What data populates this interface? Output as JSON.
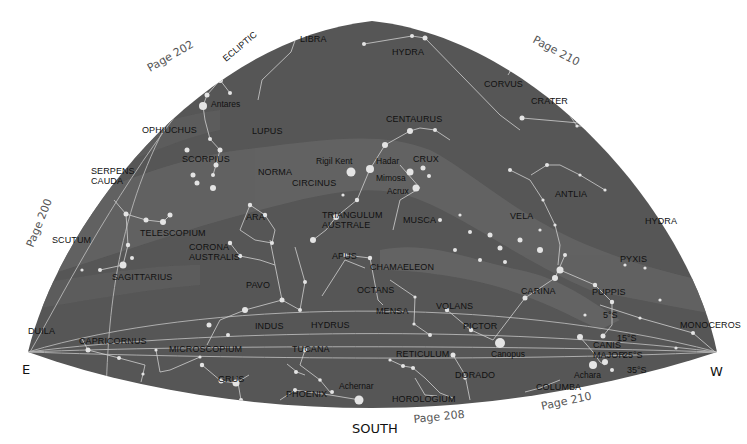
{
  "map": {
    "title": "Southern sky star chart",
    "directions": {
      "east": "E",
      "west": "W",
      "south": "SOUTH"
    },
    "page_refs": [
      {
        "label": "Page 202",
        "x": 150,
        "y": 72,
        "rot": -30
      },
      {
        "label": "Page 210",
        "x": 532,
        "y": 42,
        "rot": 28
      },
      {
        "label": "Page 200",
        "x": 33,
        "y": 248,
        "rot": -68
      },
      {
        "label": "Page 208",
        "x": 414,
        "y": 423,
        "rot": -6
      },
      {
        "label": "Page 210",
        "x": 542,
        "y": 410,
        "rot": -12
      }
    ],
    "ecliptic_label": {
      "label": "ECLIPTIC",
      "x": 226,
      "y": 62,
      "rot": -40
    },
    "declination_labels": [
      {
        "label": "5°S",
        "x": 603,
        "y": 318
      },
      {
        "label": "15°S",
        "x": 617,
        "y": 341
      },
      {
        "label": "25°S",
        "x": 623,
        "y": 358
      },
      {
        "label": "35°S",
        "x": 627,
        "y": 373
      }
    ],
    "constellations": [
      {
        "name": "LIBRA",
        "x": 300,
        "y": 42
      },
      {
        "name": "HYDRA",
        "x": 392,
        "y": 55
      },
      {
        "name": "CORVUS",
        "x": 484,
        "y": 87
      },
      {
        "name": "CRATER",
        "x": 531,
        "y": 104
      },
      {
        "name": "OPHIUCHUS",
        "x": 142,
        "y": 133
      },
      {
        "name": "LUPUS",
        "x": 252,
        "y": 134
      },
      {
        "name": "CENTAURUS",
        "x": 386,
        "y": 122
      },
      {
        "name": "SERPENS",
        "x": 91,
        "y": 174
      },
      {
        "name": "CAUDA",
        "x": 91,
        "y": 184
      },
      {
        "name": "SCORPIUS",
        "x": 182,
        "y": 162
      },
      {
        "name": "NORMA",
        "x": 258,
        "y": 175
      },
      {
        "name": "CIRCINUS",
        "x": 292,
        "y": 186
      },
      {
        "name": "CRUX",
        "x": 413,
        "y": 162
      },
      {
        "name": "ANTLIA",
        "x": 555,
        "y": 197
      },
      {
        "name": "HYDRA",
        "x": 645,
        "y": 224
      },
      {
        "name": "ARA",
        "x": 246,
        "y": 220
      },
      {
        "name": "TRIANGULUM",
        "x": 322,
        "y": 218
      },
      {
        "name": "AUSTRALE",
        "x": 322,
        "y": 228
      },
      {
        "name": "MUSCA",
        "x": 403,
        "y": 223
      },
      {
        "name": "VELA",
        "x": 510,
        "y": 219
      },
      {
        "name": "SCUTUM",
        "x": 52,
        "y": 243
      },
      {
        "name": "TELESCOPIUM",
        "x": 140,
        "y": 236
      },
      {
        "name": "CORONA",
        "x": 189,
        "y": 250
      },
      {
        "name": "AUSTRALIS",
        "x": 189,
        "y": 260
      },
      {
        "name": "APUS",
        "x": 332,
        "y": 259
      },
      {
        "name": "PYXIS",
        "x": 620,
        "y": 262
      },
      {
        "name": "CHAMAELEON",
        "x": 370,
        "y": 270
      },
      {
        "name": "SAGITTARIUS",
        "x": 112,
        "y": 280
      },
      {
        "name": "PAVO",
        "x": 246,
        "y": 288
      },
      {
        "name": "OCTANS",
        "x": 357,
        "y": 293
      },
      {
        "name": "CARINA",
        "x": 521,
        "y": 294
      },
      {
        "name": "PUPPIS",
        "x": 592,
        "y": 295
      },
      {
        "name": "MENSA",
        "x": 376,
        "y": 314
      },
      {
        "name": "VOLANS",
        "x": 436,
        "y": 309
      },
      {
        "name": "DUILA",
        "x": 28,
        "y": 334
      },
      {
        "name": "MONOCEROS",
        "x": 680,
        "y": 328
      },
      {
        "name": "INDUS",
        "x": 255,
        "y": 329
      },
      {
        "name": "HYDRUS",
        "x": 311,
        "y": 328
      },
      {
        "name": "PICTOR",
        "x": 463,
        "y": 329
      },
      {
        "name": "CAPRICORNUS",
        "x": 79,
        "y": 344
      },
      {
        "name": "MICROSCOPIUM",
        "x": 169,
        "y": 352
      },
      {
        "name": "TUCANA",
        "x": 292,
        "y": 352
      },
      {
        "name": "RETICULUM",
        "x": 396,
        "y": 357
      },
      {
        "name": "CANIS",
        "x": 593,
        "y": 348
      },
      {
        "name": "MAJOR",
        "x": 593,
        "y": 358
      },
      {
        "name": "GRUS",
        "x": 218,
        "y": 382
      },
      {
        "name": "DORADO",
        "x": 455,
        "y": 378
      },
      {
        "name": "PHOENIX",
        "x": 286,
        "y": 397
      },
      {
        "name": "HOROLOGIUM",
        "x": 392,
        "y": 402
      },
      {
        "name": "COLUMBA",
        "x": 536,
        "y": 390
      }
    ],
    "named_stars": [
      {
        "name": "Antares",
        "x": 211,
        "y": 107,
        "sx": 203,
        "sy": 106,
        "r": 4
      },
      {
        "name": "Rigil Kent",
        "x": 316,
        "y": 164,
        "sx": 351,
        "sy": 172,
        "r": 4.5
      },
      {
        "name": "Hadar",
        "x": 376,
        "y": 164,
        "sx": 370,
        "sy": 169,
        "r": 4
      },
      {
        "name": "Mimosa",
        "x": 376,
        "y": 181,
        "sx": 410,
        "sy": 172,
        "r": 3.5
      },
      {
        "name": "Acrux",
        "x": 387,
        "y": 194,
        "sx": 416,
        "sy": 188,
        "r": 3.5
      },
      {
        "name": "Canopus",
        "x": 491,
        "y": 357,
        "sx": 500,
        "sy": 343,
        "r": 5
      },
      {
        "name": "Achernar",
        "x": 339,
        "y": 389,
        "sx": 359,
        "sy": 400,
        "r": 4.5
      },
      {
        "name": "Achara",
        "x": 574,
        "y": 378,
        "sx": 593,
        "sy": 365,
        "r": 4
      }
    ]
  }
}
